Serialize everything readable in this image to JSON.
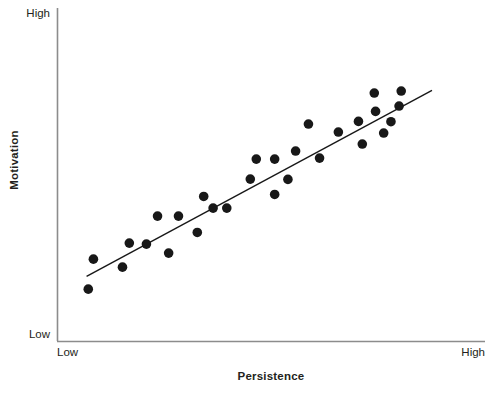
{
  "chart_data": {
    "type": "scatter",
    "title": "",
    "xlabel": "Persistence",
    "ylabel": "Motivation",
    "xtick_labels": [
      "Low",
      "High"
    ],
    "ytick_labels": [
      "Low",
      "High"
    ],
    "xlim": [
      0,
      100
    ],
    "ylim": [
      0,
      100
    ],
    "grid": false,
    "legend": null,
    "marker": {
      "shape": "circle",
      "color": "#181818",
      "radius_px": 4.8,
      "count": 29
    },
    "trendline": {
      "present": true,
      "color": "#181818",
      "width_px": 1.4,
      "x": [
        6.8,
        87.6
      ],
      "y": [
        19.5,
        75.3
      ]
    },
    "axis_color": "#8c8c8c",
    "points": [
      {
        "x": 8.4,
        "y": 24.7
      },
      {
        "x": 7.2,
        "y": 15.7
      },
      {
        "x": 15.2,
        "y": 22.3
      },
      {
        "x": 16.8,
        "y": 29.5
      },
      {
        "x": 20.8,
        "y": 29.2
      },
      {
        "x": 23.4,
        "y": 37.6
      },
      {
        "x": 26.0,
        "y": 26.5
      },
      {
        "x": 28.3,
        "y": 37.6
      },
      {
        "x": 32.7,
        "y": 32.7
      },
      {
        "x": 34.2,
        "y": 43.5
      },
      {
        "x": 36.4,
        "y": 40.0
      },
      {
        "x": 39.6,
        "y": 40.0
      },
      {
        "x": 45.1,
        "y": 48.7
      },
      {
        "x": 46.5,
        "y": 54.7
      },
      {
        "x": 50.8,
        "y": 54.7
      },
      {
        "x": 50.8,
        "y": 44.1
      },
      {
        "x": 53.9,
        "y": 48.6
      },
      {
        "x": 55.7,
        "y": 57.1
      },
      {
        "x": 58.7,
        "y": 65.2
      },
      {
        "x": 61.3,
        "y": 55.0
      },
      {
        "x": 65.7,
        "y": 62.8
      },
      {
        "x": 70.4,
        "y": 66.0
      },
      {
        "x": 71.3,
        "y": 59.2
      },
      {
        "x": 74.1,
        "y": 74.5
      },
      {
        "x": 74.4,
        "y": 69.0
      },
      {
        "x": 76.3,
        "y": 62.5
      },
      {
        "x": 78.0,
        "y": 65.9
      },
      {
        "x": 80.4,
        "y": 75.1
      },
      {
        "x": 79.9,
        "y": 70.6
      }
    ]
  }
}
